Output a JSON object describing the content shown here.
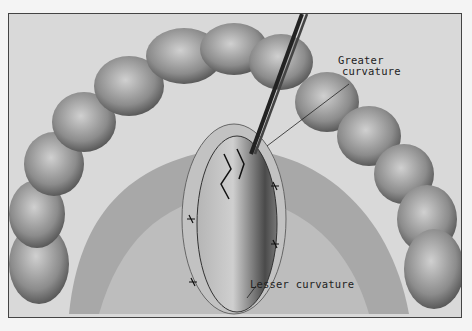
{
  "figure": {
    "labels": {
      "greater": "Greater\ncurvature",
      "greater_line1": "Greater",
      "greater_line2": "curvature",
      "lesser": "Lesser curvature"
    },
    "colors": {
      "background": "#d9d9d9",
      "tissue_light": "#c8c8c8",
      "tissue_mid": "#9a9a9a",
      "tissue_dark": "#555555",
      "ink": "#222222"
    }
  }
}
